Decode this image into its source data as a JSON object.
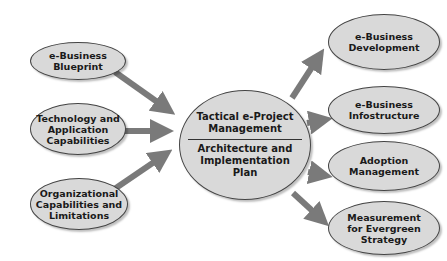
{
  "inputs": [
    {
      "id": "blueprint",
      "lines": [
        "e-Business",
        "Blueprint"
      ]
    },
    {
      "id": "technology",
      "lines": [
        "Technology and",
        "Application",
        "Capabilities"
      ]
    },
    {
      "id": "organizational",
      "lines": [
        "Organizational",
        "Capabilities and",
        "Limitations"
      ]
    }
  ],
  "center": {
    "top_lines": [
      "Tactical e-Project",
      "Management"
    ],
    "bottom_lines": [
      "Architecture and",
      "Implementation",
      "Plan"
    ]
  },
  "outputs": [
    {
      "id": "development",
      "lines": [
        "e-Business",
        "Development"
      ]
    },
    {
      "id": "infostructure",
      "lines": [
        "e-Business",
        "Infostructure"
      ]
    },
    {
      "id": "adoption",
      "lines": [
        "Adoption",
        "Management"
      ]
    },
    {
      "id": "measurement",
      "lines": [
        "Measurement",
        "for Evergreen",
        "Strategy"
      ]
    }
  ],
  "colors": {
    "node_fill": "#d9d9d9",
    "node_border": "#444444",
    "arrow": "#7a7a7a"
  }
}
